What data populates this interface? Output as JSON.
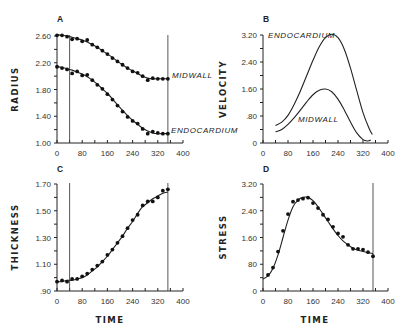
{
  "chart_data": [
    {
      "panel": "A",
      "type": "line",
      "title": "",
      "xlabel": "",
      "ylabel": "RADIUS",
      "xlim": [
        0,
        400
      ],
      "ylim": [
        1.0,
        2.6
      ],
      "xticks": [
        "0",
        "80",
        "160",
        "240",
        "320",
        "400"
      ],
      "yticks": [
        "1.00",
        "1.40",
        "1.80",
        "2.20",
        "2.60"
      ],
      "vertical_lines": [
        40,
        352
      ],
      "grid": false,
      "series": [
        {
          "name": "MIDWALL",
          "x": [
            0,
            16,
            32,
            48,
            64,
            80,
            96,
            112,
            128,
            144,
            160,
            176,
            192,
            208,
            224,
            240,
            256,
            272,
            288,
            304,
            320,
            336,
            352
          ],
          "points": [
            2.61,
            2.61,
            2.59,
            2.55,
            2.56,
            2.52,
            2.54,
            2.47,
            2.43,
            2.38,
            2.33,
            2.27,
            2.22,
            2.17,
            2.12,
            2.07,
            2.05,
            2.0,
            1.94,
            1.97,
            1.96,
            1.96,
            1.96
          ],
          "fit": [
            2.62,
            2.61,
            2.6,
            2.58,
            2.56,
            2.54,
            2.51,
            2.47,
            2.43,
            2.38,
            2.33,
            2.28,
            2.22,
            2.17,
            2.12,
            2.08,
            2.04,
            2.0,
            1.97,
            1.96,
            1.96,
            1.96,
            1.96
          ]
        },
        {
          "name": "ENDOCARDIUM",
          "x": [
            0,
            16,
            32,
            48,
            64,
            80,
            96,
            112,
            128,
            144,
            160,
            176,
            192,
            208,
            224,
            240,
            256,
            272,
            288,
            304,
            320,
            336,
            352
          ],
          "points": [
            2.14,
            2.12,
            2.1,
            2.04,
            2.07,
            2.01,
            2.02,
            1.94,
            1.87,
            1.81,
            1.73,
            1.65,
            1.56,
            1.47,
            1.39,
            1.33,
            1.29,
            1.21,
            1.14,
            1.17,
            1.15,
            1.14,
            1.14
          ],
          "fit": [
            2.14,
            2.13,
            2.11,
            2.09,
            2.06,
            2.03,
            1.99,
            1.94,
            1.88,
            1.81,
            1.74,
            1.66,
            1.57,
            1.49,
            1.41,
            1.34,
            1.28,
            1.22,
            1.18,
            1.15,
            1.14,
            1.14,
            1.14
          ]
        }
      ]
    },
    {
      "panel": "B",
      "type": "line",
      "title": "",
      "xlabel": "",
      "ylabel": "VELOCITY",
      "xlim": [
        0,
        400
      ],
      "ylim": [
        0,
        3.2
      ],
      "xticks": [
        "0",
        "80",
        "160",
        "240",
        "320",
        "400"
      ],
      "yticks": [
        "0",
        ".80",
        "1.60",
        "2.40",
        "3.20"
      ],
      "grid": false,
      "series": [
        {
          "name": "ENDOCARDIUM",
          "x": [
            40,
            60,
            80,
            100,
            120,
            140,
            160,
            180,
            200,
            220,
            240,
            260,
            280,
            300,
            320,
            340,
            350
          ],
          "values": [
            0.52,
            0.62,
            0.82,
            1.15,
            1.55,
            2.0,
            2.45,
            2.85,
            3.12,
            3.22,
            3.12,
            2.78,
            2.22,
            1.55,
            0.9,
            0.42,
            0.25
          ]
        },
        {
          "name": "MIDWALL",
          "x": [
            40,
            60,
            80,
            100,
            120,
            140,
            160,
            180,
            200,
            220,
            240,
            260,
            280,
            300,
            320,
            335,
            345
          ],
          "values": [
            0.33,
            0.4,
            0.55,
            0.75,
            0.98,
            1.22,
            1.43,
            1.56,
            1.6,
            1.52,
            1.3,
            0.98,
            0.62,
            0.3,
            0.1,
            0.06,
            0.09
          ]
        }
      ]
    },
    {
      "panel": "C",
      "type": "line",
      "title": "",
      "xlabel": "TIME",
      "ylabel": "THICKNESS",
      "xlim": [
        0,
        400
      ],
      "ylim": [
        0.9,
        1.7
      ],
      "xticks": [
        "0",
        "80",
        "160",
        "240",
        "320",
        "400"
      ],
      "yticks": [
        ".90",
        "1.10",
        "1.30",
        "1.50",
        "1.70"
      ],
      "vertical_lines": [
        40,
        352
      ],
      "grid": false,
      "series": [
        {
          "name": "THICKNESS",
          "x": [
            0,
            16,
            32,
            48,
            64,
            80,
            96,
            112,
            128,
            144,
            160,
            176,
            192,
            208,
            224,
            240,
            256,
            272,
            288,
            304,
            320,
            336,
            352
          ],
          "points": [
            0.97,
            0.98,
            0.97,
            0.99,
            0.99,
            1.01,
            1.03,
            1.06,
            1.09,
            1.12,
            1.17,
            1.21,
            1.26,
            1.31,
            1.37,
            1.43,
            1.47,
            1.54,
            1.57,
            1.57,
            1.6,
            1.65,
            1.66
          ],
          "fit": [
            0.97,
            0.97,
            0.98,
            0.98,
            0.99,
            1.0,
            1.02,
            1.05,
            1.08,
            1.12,
            1.16,
            1.21,
            1.26,
            1.31,
            1.37,
            1.42,
            1.48,
            1.53,
            1.56,
            1.59,
            1.61,
            1.63,
            1.64
          ]
        }
      ]
    },
    {
      "panel": "D",
      "type": "line",
      "title": "",
      "xlabel": "TIME",
      "ylabel": "STRESS",
      "xlim": [
        0,
        400
      ],
      "ylim": [
        0,
        3.2
      ],
      "xticks": [
        "0",
        "80",
        "160",
        "240",
        "320",
        "400"
      ],
      "yticks": [
        "0",
        "80",
        "1.60",
        "2.40",
        "3.20"
      ],
      "vertical_lines": [
        352
      ],
      "grid": false,
      "series": [
        {
          "name": "STRESS",
          "x": [
            16,
            32,
            48,
            64,
            80,
            96,
            112,
            128,
            144,
            160,
            176,
            192,
            208,
            224,
            240,
            256,
            272,
            288,
            304,
            320,
            336,
            352
          ],
          "points": [
            0.48,
            0.7,
            1.18,
            1.8,
            2.3,
            2.67,
            2.72,
            2.76,
            2.79,
            2.63,
            2.48,
            2.28,
            2.14,
            1.92,
            1.72,
            1.62,
            1.38,
            1.26,
            1.26,
            1.24,
            1.16,
            1.04
          ],
          "fit_x": [
            0,
            16,
            32,
            48,
            64,
            80,
            96,
            112,
            128,
            144,
            160,
            176,
            192,
            208,
            224,
            240,
            256,
            272,
            288,
            304,
            320,
            336,
            352
          ],
          "fit": [
            0.36,
            0.45,
            0.68,
            1.08,
            1.6,
            2.12,
            2.52,
            2.72,
            2.8,
            2.8,
            2.7,
            2.52,
            2.3,
            2.08,
            1.86,
            1.66,
            1.5,
            1.38,
            1.28,
            1.22,
            1.18,
            1.15,
            1.12
          ]
        }
      ]
    }
  ]
}
